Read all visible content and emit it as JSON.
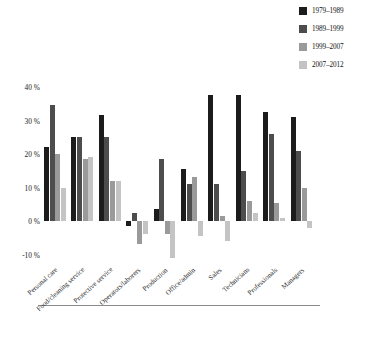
{
  "chart_data": {
    "type": "bar",
    "title": "",
    "xlabel": "",
    "ylabel": "",
    "ylim": [
      -13,
      42
    ],
    "yticks": [
      "40 %",
      "30 %",
      "20 %",
      "10 %",
      "0 %",
      "-10 %"
    ],
    "ytick_values": [
      40,
      30,
      20,
      10,
      0,
      -10
    ],
    "grid": false,
    "legend_position": "top-right",
    "categories": [
      "Personal care",
      "Food/cleaning service",
      "Protective service",
      "Operators/laborers",
      "Production",
      "Office/admin",
      "Sales",
      "Technicians",
      "Professionals",
      "Managers"
    ],
    "series": [
      {
        "name": "1979–1989",
        "color": "#1c1c1c",
        "values": [
          22,
          25,
          31.5,
          -1.5,
          3.5,
          15.5,
          37.5,
          37.5,
          32.5,
          31
        ]
      },
      {
        "name": "1989–1999",
        "color": "#4d4d4d",
        "values": [
          34.5,
          25,
          25,
          2.5,
          18.5,
          11,
          11,
          15,
          26,
          21
        ]
      },
      {
        "name": "1999–2007",
        "color": "#9a9a9a",
        "values": [
          20,
          18.5,
          12,
          -7,
          -4,
          13,
          1.5,
          6,
          5.5,
          10
        ]
      },
      {
        "name": "2007–2012",
        "color": "#c4c4c4",
        "values": [
          10,
          19,
          12,
          -4,
          -11,
          -4.5,
          -6,
          2.5,
          1,
          -2
        ]
      }
    ]
  },
  "caption": {
    "figure_number": "FIGURE 3.3",
    "text": "Percentage growth by occupational categories over time"
  }
}
